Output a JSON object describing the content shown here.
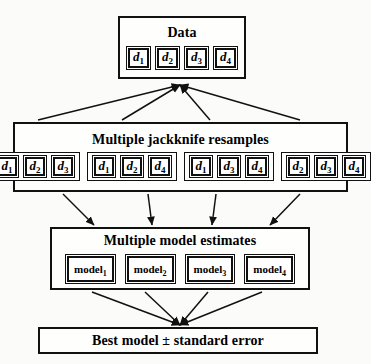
{
  "diagram": {
    "style": {
      "ink": "#111111",
      "paper": "#fbfbf9"
    }
  },
  "data_box": {
    "title": "Data",
    "items": [
      {
        "base": "d",
        "sub": "1"
      },
      {
        "base": "d",
        "sub": "2"
      },
      {
        "base": "d",
        "sub": "3"
      },
      {
        "base": "d",
        "sub": "4"
      }
    ]
  },
  "resample_box": {
    "title": "Multiple jackknife resamples",
    "groups": [
      {
        "items": [
          {
            "base": "d",
            "sub": "1"
          },
          {
            "base": "d",
            "sub": "2"
          },
          {
            "base": "d",
            "sub": "3"
          }
        ]
      },
      {
        "items": [
          {
            "base": "d",
            "sub": "1"
          },
          {
            "base": "d",
            "sub": "2"
          },
          {
            "base": "d",
            "sub": "4"
          }
        ]
      },
      {
        "items": [
          {
            "base": "d",
            "sub": "1"
          },
          {
            "base": "d",
            "sub": "3"
          },
          {
            "base": "d",
            "sub": "4"
          }
        ]
      },
      {
        "items": [
          {
            "base": "d",
            "sub": "2"
          },
          {
            "base": "d",
            "sub": "3"
          },
          {
            "base": "d",
            "sub": "4"
          }
        ]
      }
    ]
  },
  "model_box": {
    "title": "Multiple model estimates",
    "items": [
      {
        "base": "model",
        "sub": "1"
      },
      {
        "base": "model",
        "sub": "2"
      },
      {
        "base": "model",
        "sub": "3"
      },
      {
        "base": "model",
        "sub": "4"
      }
    ]
  },
  "final_box": {
    "title": "Best model ± standard error"
  },
  "edges": {
    "data_to_resamples": {
      "direction": "up",
      "converge_point": {
        "x": 180,
        "y": 85
      },
      "from_points": [
        {
          "x": 38,
          "y": 120
        },
        {
          "x": 122,
          "y": 120
        },
        {
          "x": 210,
          "y": 120
        },
        {
          "x": 300,
          "y": 120
        }
      ]
    },
    "resamples_to_models": {
      "direction": "down",
      "segments": [
        {
          "x1": 63,
          "y1": 194,
          "x2": 94,
          "y2": 225
        },
        {
          "x1": 148,
          "y1": 194,
          "x2": 152,
          "y2": 225
        },
        {
          "x1": 216,
          "y1": 194,
          "x2": 212,
          "y2": 225
        },
        {
          "x1": 300,
          "y1": 194,
          "x2": 270,
          "y2": 225
        }
      ]
    },
    "models_to_final": {
      "direction": "down",
      "converge_point": {
        "x": 180,
        "y": 325
      },
      "from_points": [
        {
          "x": 92,
          "y": 292
        },
        {
          "x": 145,
          "y": 292
        },
        {
          "x": 208,
          "y": 292
        },
        {
          "x": 262,
          "y": 292
        }
      ]
    }
  }
}
